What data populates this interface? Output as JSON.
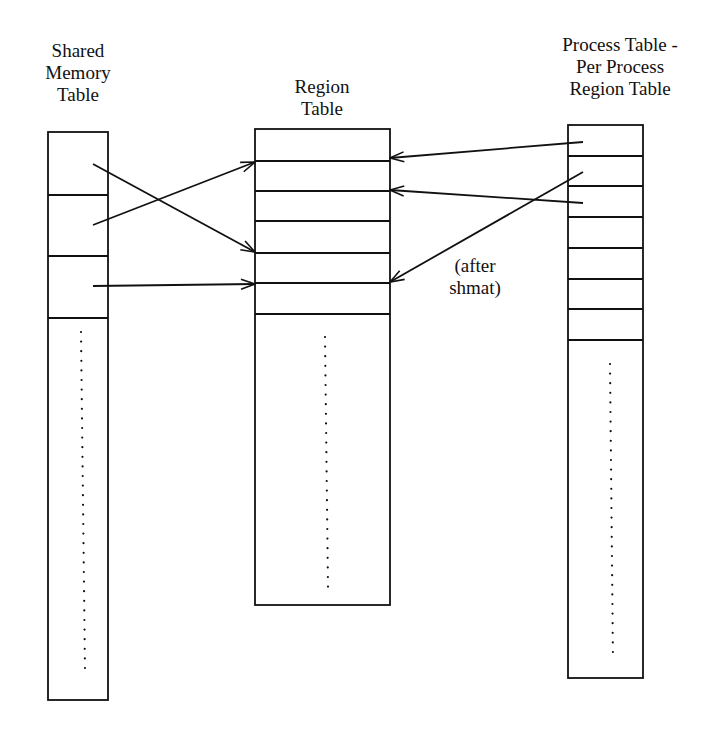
{
  "diagram": {
    "type": "shared-memory-data-structures",
    "colors": {
      "ink": "#111111",
      "background": "#ffffff"
    },
    "tables": {
      "shared_memory": {
        "title_lines": [
          "Shared",
          "Memory",
          "Table"
        ],
        "entries_shown": 3,
        "continues": true
      },
      "region": {
        "title_lines": [
          "Region",
          "Table"
        ],
        "entries_shown": 6,
        "continues": true
      },
      "per_process_region": {
        "title_lines": [
          "Process Table -",
          "Per Process",
          "Region Table"
        ],
        "entries_shown": 7,
        "continues": true
      }
    },
    "annotation": {
      "lines": [
        "(after",
        "shmat)"
      ]
    },
    "arrows": [
      {
        "from": "shared_memory.entry1",
        "to": "region.boundary4"
      },
      {
        "from": "shared_memory.entry2",
        "to": "region.boundary1"
      },
      {
        "from": "shared_memory.entry3",
        "to": "region.boundary5"
      },
      {
        "from": "per_process_region.entry1",
        "to": "region.boundary1"
      },
      {
        "from": "per_process_region.entry3",
        "to": "region.boundary2"
      },
      {
        "from": "per_process_region.entry2",
        "to": "region.boundary5",
        "note": "after shmat"
      }
    ]
  }
}
